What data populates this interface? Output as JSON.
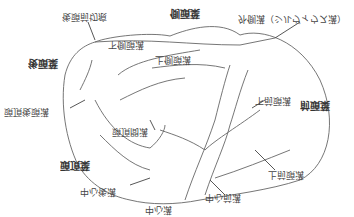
{
  "diagram": {
    "orientation": "vertically-flipped",
    "stroke_color": "#555555",
    "lobes": [
      {
        "id": "frontal",
        "label": "前頭葉",
        "x": 300,
        "y": 100
      },
      {
        "id": "parietal",
        "label": "頭頂葉",
        "x": 60,
        "y": 160
      },
      {
        "id": "occipital",
        "label": "後頭葉",
        "x": 28,
        "y": 58
      },
      {
        "id": "temporal",
        "label": "側頭葉",
        "x": 170,
        "y": 8
      }
    ],
    "sulci": [
      {
        "id": "preoccipital-notch",
        "label": "後頭前切痕",
        "x": 62,
        "y": 12
      },
      {
        "id": "inferior-temporal",
        "label": "下側頭溝",
        "x": 108,
        "y": 40
      },
      {
        "id": "superior-temporal",
        "label": "上側頭溝",
        "x": 155,
        "y": 55
      },
      {
        "id": "lateral",
        "label": "外側溝（シルヴィウス溝）",
        "x": 238,
        "y": 14
      },
      {
        "id": "inferior-frontal",
        "label": "下前頭溝",
        "x": 255,
        "y": 96
      },
      {
        "id": "parieto-occipital",
        "label": "頭頂後頭溝",
        "x": 4,
        "y": 107
      },
      {
        "id": "intraparietal",
        "label": "頭頂間溝",
        "x": 112,
        "y": 127
      },
      {
        "id": "superior-frontal",
        "label": "上前頭溝",
        "x": 268,
        "y": 170
      },
      {
        "id": "postcentral",
        "label": "中心後溝",
        "x": 80,
        "y": 187
      },
      {
        "id": "precentral",
        "label": "中心前溝",
        "x": 205,
        "y": 193
      },
      {
        "id": "central",
        "label": "中心溝",
        "x": 145,
        "y": 205
      }
    ]
  }
}
